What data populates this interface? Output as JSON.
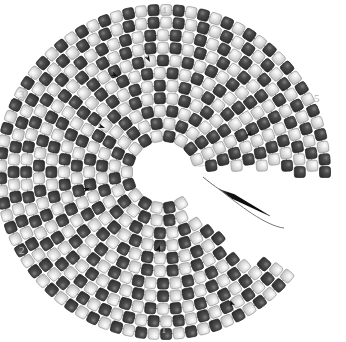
{
  "diagram": {
    "type": "bead-weaving-schematic",
    "width": 346,
    "height": 342,
    "background_color": "#ffffff",
    "center": {
      "x": 163,
      "y": 172
    },
    "gap_wedge": {
      "start_deg": -6,
      "end_deg": 58,
      "description": "open wedge where the spiral has not yet been filled"
    },
    "segment_labels": [
      {
        "id": "1",
        "text": "1",
        "x": 161,
        "y": 324,
        "color": "#b0b0b0"
      },
      {
        "id": "2",
        "text": "2",
        "x": 19,
        "y": 245,
        "color": "#b0b0b0"
      },
      {
        "id": "3",
        "text": "3",
        "x": 19,
        "y": 89,
        "color": "#b0b0b0"
      },
      {
        "id": "4",
        "text": "4",
        "x": 161,
        "y": 5,
        "color": "#b0b0b0"
      },
      {
        "id": "5",
        "text": "5",
        "x": 314,
        "y": 93,
        "color": "#b0b0b0"
      }
    ],
    "bead_colors": {
      "dark": "#3d3d3d",
      "dark_highlight": "#6e6e6e",
      "dark_edge": "#222222",
      "light": "#dcdcdc",
      "light_highlight": "#ffffff",
      "light_edge": "#9a9a9a"
    },
    "thread": {
      "color": "#8c8c8c",
      "width": 1.1,
      "description": "grey thread looping between beads along each row"
    },
    "needle": {
      "color": "#101010",
      "tail_color": "#6a6a6a",
      "x1": 219,
      "y1": 189,
      "x2": 270,
      "y2": 216,
      "description": "beading needle with trailing thread exiting the open wedge"
    },
    "bead_geometry": {
      "size": 11,
      "corner_radius": 2.6,
      "ring_count": 11,
      "inner_radius": 36,
      "ring_step": 12.6,
      "spokes": 40
    },
    "arrow_markers": [
      {
        "x": 118,
        "y": 77,
        "angle": 30
      },
      {
        "x": 105,
        "y": 128,
        "angle": 20
      },
      {
        "x": 90,
        "y": 188,
        "angle": -18
      },
      {
        "x": 160,
        "y": 245,
        "angle": -70
      },
      {
        "x": 230,
        "y": 300,
        "angle": -115
      },
      {
        "x": 246,
        "y": 136,
        "angle": 150
      },
      {
        "x": 150,
        "y": 62,
        "angle": 62
      }
    ]
  }
}
